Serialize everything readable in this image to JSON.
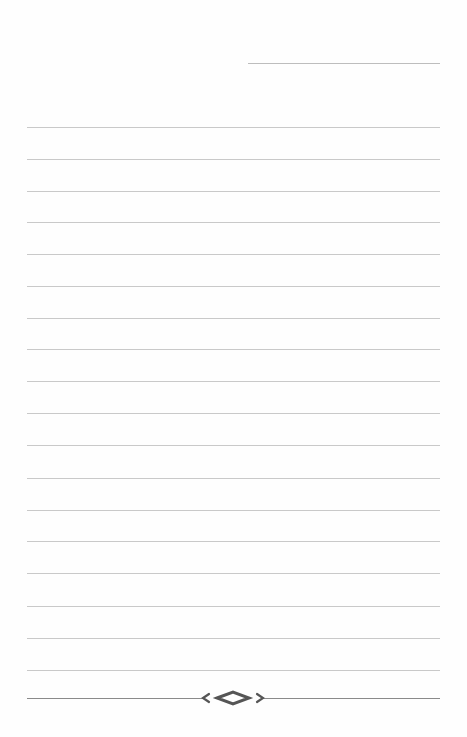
{
  "page": {
    "type": "lined-notepaper",
    "background": "#fefefe",
    "line_color": "#c9c9c9",
    "ornament_color": "#555555"
  },
  "date_line": {
    "x": 248,
    "y": 63,
    "width": 192
  },
  "ruled_lines": {
    "x": 27,
    "width": 413,
    "y_positions": [
      127,
      159,
      191,
      222,
      254,
      286,
      318,
      349,
      381,
      413,
      445,
      478,
      510,
      541,
      573,
      606,
      638,
      670
    ]
  },
  "footer": {
    "ornament_icon": "diamond-flourish-icon",
    "line_y": 698
  }
}
